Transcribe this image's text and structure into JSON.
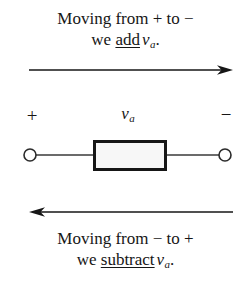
{
  "figure": {
    "background_color": "#ffffff",
    "ink_color": "#161616"
  },
  "caption_top": {
    "line1": "Moving from + to −",
    "line2_prefix": "we ",
    "line2_emphasis": "add",
    "line2_variable": "v",
    "line2_subscript": "a",
    "line2_suffix": "."
  },
  "caption_bottom": {
    "line1": "Moving from − to +",
    "line2_prefix": "we ",
    "line2_emphasis": "subtract",
    "line2_variable": "v",
    "line2_subscript": "a",
    "line2_suffix": "."
  },
  "arrows": {
    "top": {
      "direction": "right",
      "x_start": 29,
      "x_end": 233,
      "y": 12,
      "stroke_color": "#161616",
      "stroke_width": 1.3
    },
    "bottom": {
      "direction": "left",
      "x_start": 233,
      "x_end": 29,
      "y": 12,
      "stroke_color": "#161616",
      "stroke_width": 1.3
    }
  },
  "circuit": {
    "polarity_positive": "+",
    "polarity_negative": "−",
    "element_label_variable": "v",
    "element_label_subscript": "a",
    "element": {
      "type": "rectangular-two-terminal-element",
      "box_x": 93,
      "box_y": 42,
      "box_width": 74,
      "box_height": 31,
      "box_fill": "#f7f7f7",
      "box_stroke": "#161616",
      "box_stroke_width": 3
    },
    "terminals": {
      "left_cx": 30,
      "right_cx": 225,
      "cy": 57,
      "radius": 6,
      "fill": "#ffffff",
      "stroke": "#2b2b2b",
      "stroke_width": 1.6
    },
    "leads": {
      "stroke": "#3a3a3a",
      "stroke_width": 1.4
    }
  }
}
